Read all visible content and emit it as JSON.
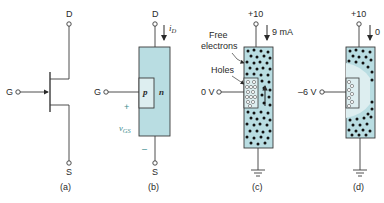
{
  "colors": {
    "channel_fill": "#b9dde2",
    "gate_region_fill": "#ddeef0",
    "line": "#3a3a3a",
    "electron": "#111111",
    "accent_text": "#3a8a8c"
  },
  "panels": [
    {
      "id": "a",
      "caption": "(a)",
      "drain_label": "D",
      "gate_label": "G",
      "source_label": "S",
      "description": "JFET schematic symbol (n-channel)"
    },
    {
      "id": "b",
      "caption": "(b)",
      "drain_label": "D",
      "gate_label": "G",
      "source_label": "S",
      "current_label": "i",
      "current_subscript": "D",
      "p_region_label": "p",
      "n_region_label": "n",
      "vgs_label": "v",
      "vgs_subscript": "GS",
      "plus_sign": "+",
      "minus_sign": "–"
    },
    {
      "id": "c",
      "caption": "(c)",
      "supply_label": "+10",
      "current_value": "9 mA",
      "gate_voltage": "0 V",
      "free_electrons_label_line1": "Free",
      "free_electrons_label_line2": "electrons",
      "holes_label": "Holes"
    },
    {
      "id": "d",
      "caption": "(d)",
      "supply_label": "+10",
      "current_value": "0",
      "gate_voltage": "–6 V"
    }
  ]
}
